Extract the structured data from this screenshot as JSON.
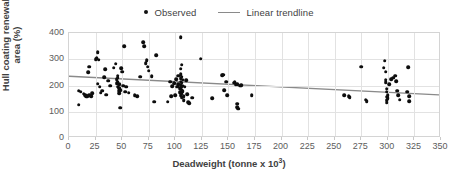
{
  "chart_data": {
    "type": "scatter",
    "title": "",
    "xlabel": "Deadweight (tonne x 10³)",
    "ylabel": "Hull coating renewal area (%)",
    "xlim": [
      0,
      350
    ],
    "ylim": [
      0,
      400
    ],
    "xticks": [
      0,
      25,
      50,
      75,
      100,
      125,
      150,
      175,
      200,
      225,
      250,
      275,
      300,
      325,
      350
    ],
    "yticks": [
      0,
      100,
      200,
      300,
      400
    ],
    "grid": true,
    "legend_position": "top-center",
    "series": [
      {
        "name": "Observed",
        "type": "scatter",
        "marker": "circle",
        "color": "#0d0d0d",
        "points": [
          [
            9,
            180
          ],
          [
            9,
            127
          ],
          [
            11,
            176
          ],
          [
            14,
            168
          ],
          [
            15,
            163
          ],
          [
            16,
            160
          ],
          [
            17,
            160
          ],
          [
            18,
            250
          ],
          [
            19,
            272
          ],
          [
            19,
            163
          ],
          [
            21,
            159
          ],
          [
            22,
            171
          ],
          [
            25,
            300
          ],
          [
            26,
            305
          ],
          [
            27,
            326
          ],
          [
            27,
            207
          ],
          [
            28,
            298
          ],
          [
            29,
            195
          ],
          [
            30,
            172
          ],
          [
            31,
            180
          ],
          [
            33,
            232
          ],
          [
            34,
            262
          ],
          [
            35,
            165
          ],
          [
            37,
            218
          ],
          [
            39,
            200
          ],
          [
            42,
            268
          ],
          [
            44,
            283
          ],
          [
            45,
            224
          ],
          [
            45,
            208
          ],
          [
            46,
            196
          ],
          [
            46,
            238
          ],
          [
            46,
            230
          ],
          [
            46,
            215
          ],
          [
            47,
            205
          ],
          [
            47,
            190
          ],
          [
            47,
            180
          ],
          [
            47,
            170
          ],
          [
            48,
            182
          ],
          [
            48,
            115
          ],
          [
            49,
            265
          ],
          [
            50,
            252
          ],
          [
            51,
            200
          ],
          [
            52,
            349
          ],
          [
            53,
            176
          ],
          [
            54,
            196
          ],
          [
            56,
            172
          ],
          [
            62,
            162
          ],
          [
            64,
            160
          ],
          [
            67,
            234
          ],
          [
            70,
            366
          ],
          [
            71,
            349
          ],
          [
            72,
            286
          ],
          [
            73,
            296
          ],
          [
            74,
            272
          ],
          [
            75,
            256
          ],
          [
            78,
            236
          ],
          [
            80,
            138
          ],
          [
            82,
            316
          ],
          [
            93,
            139
          ],
          [
            95,
            215
          ],
          [
            96,
            160
          ],
          [
            97,
            197
          ],
          [
            99,
            208
          ],
          [
            100,
            163
          ],
          [
            101,
            224
          ],
          [
            102,
            195
          ],
          [
            103,
            237
          ],
          [
            103,
            206
          ],
          [
            104,
            190
          ],
          [
            104,
            175
          ],
          [
            105,
            383
          ],
          [
            105,
            264
          ],
          [
            105,
            243
          ],
          [
            105,
            228
          ],
          [
            105,
            215
          ],
          [
            105,
            202
          ],
          [
            105,
            188
          ],
          [
            105,
            176
          ],
          [
            105,
            163
          ],
          [
            106,
            280
          ],
          [
            106,
            234
          ],
          [
            106,
            210
          ],
          [
            106,
            196
          ],
          [
            106,
            182
          ],
          [
            106,
            168
          ],
          [
            106,
            155
          ],
          [
            107,
            222
          ],
          [
            107,
            200
          ],
          [
            107,
            178
          ],
          [
            108,
            160
          ],
          [
            108,
            145
          ],
          [
            109,
            196
          ],
          [
            110,
            220
          ],
          [
            111,
            166
          ],
          [
            112,
            137
          ],
          [
            113,
            133
          ],
          [
            116,
            153
          ],
          [
            124,
            302
          ],
          [
            135,
            152
          ],
          [
            144,
            239
          ],
          [
            145,
            241
          ],
          [
            146,
            182
          ],
          [
            148,
            215
          ],
          [
            149,
            162
          ],
          [
            155,
            210
          ],
          [
            156,
            212
          ],
          [
            157,
            205
          ],
          [
            158,
            205
          ],
          [
            158,
            131
          ],
          [
            158,
            118
          ],
          [
            159,
            112
          ],
          [
            161,
            200
          ],
          [
            162,
            202
          ],
          [
            172,
            163
          ],
          [
            259,
            164
          ],
          [
            263,
            160
          ],
          [
            264,
            156
          ],
          [
            275,
            272
          ],
          [
            279,
            146
          ],
          [
            280,
            140
          ],
          [
            296,
            268
          ],
          [
            297,
            294
          ],
          [
            298,
            252
          ],
          [
            298,
            222
          ],
          [
            298,
            212
          ],
          [
            299,
            188
          ],
          [
            299,
            176
          ],
          [
            299,
            158
          ],
          [
            299,
            143
          ],
          [
            299,
            134
          ],
          [
            300,
            164
          ],
          [
            300,
            152
          ],
          [
            301,
            204
          ],
          [
            303,
            224
          ],
          [
            305,
            229
          ],
          [
            307,
            238
          ],
          [
            308,
            216
          ],
          [
            309,
            180
          ],
          [
            310,
            164
          ],
          [
            311,
            146
          ],
          [
            318,
            176
          ],
          [
            319,
            270
          ],
          [
            320,
            160
          ],
          [
            320,
            140
          ]
        ]
      },
      {
        "name": "Linear trendline",
        "type": "line",
        "color": "#8a8a8a",
        "x": [
          0,
          350
        ],
        "y": [
          232,
          160
        ]
      }
    ]
  },
  "legend": {
    "items": [
      {
        "label": "Observed",
        "marker": "dot-marker",
        "color": "#0d0d0d"
      },
      {
        "label": "Linear trendline",
        "marker": "line-marker",
        "color": "#8a8a8a"
      }
    ]
  },
  "axes": {
    "y_title": "Hull coating renewal area (%)",
    "x_title_main": "Deadweight (tonne x 10",
    "x_title_sup": "3",
    "x_title_close": ")",
    "x_tick_labels": [
      "0",
      "25",
      "50",
      "75",
      "100",
      "125",
      "150",
      "175",
      "200",
      "225",
      "250",
      "275",
      "300",
      "325",
      "350"
    ],
    "y_tick_labels": [
      "0",
      "100",
      "200",
      "300",
      "400"
    ]
  },
  "colors": {
    "point": "#0d0d0d",
    "trendline": "#8a8a8a",
    "grid": "#e2e2e2",
    "frame": "#d4d4d4",
    "text": "#3f3f3f",
    "tick_text": "#5c5c5c",
    "background": "#ffffff"
  }
}
